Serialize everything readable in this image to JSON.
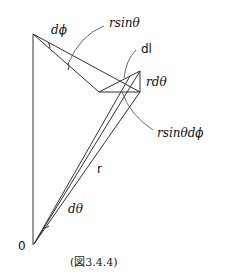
{
  "figure": {
    "caption": "(図3.4.4)",
    "labels": {
      "dphi": "dϕ",
      "rsin_theta": "rsinθ",
      "dl": "dl",
      "rdtheta": "rdθ",
      "rsin_theta_dphi": "rsinθdϕ",
      "r": "r",
      "dtheta": "dθ",
      "origin": "0"
    }
  }
}
